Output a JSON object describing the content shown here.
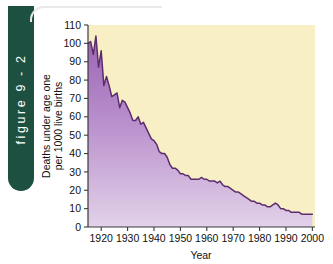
{
  "figure": {
    "tab_label": "figure 9 - 2"
  },
  "colors": {
    "tab_background": "#1d5040",
    "tab_text": "#ffffff",
    "plot_background": "#f8f0c4",
    "line": "#5c2d6e",
    "fill_top": "#9b64b4",
    "fill_bottom": "#e0cfe8",
    "axis": "#3a3a3a",
    "text": "#111111"
  },
  "chart_data": {
    "type": "area",
    "title": "",
    "xlabel": "Year",
    "ylabel": "Deaths under age one per 1000 live births",
    "ylabel_line1": "Deaths under age one",
    "ylabel_line2": "per 1000 live births",
    "xlim": [
      1915,
      2001
    ],
    "ylim": [
      0,
      110
    ],
    "grid": false,
    "legend": "none",
    "xticks": [
      1920,
      1930,
      1940,
      1950,
      1960,
      1970,
      1980,
      1990,
      2000
    ],
    "xtick_labels": [
      "1920",
      "1930",
      "1940",
      "1950",
      "1960",
      "1970",
      "1980",
      "1990",
      "2000"
    ],
    "yticks": [
      0,
      10,
      20,
      30,
      40,
      50,
      60,
      70,
      80,
      90,
      100,
      110
    ],
    "ytick_labels": [
      "0",
      "10",
      "20",
      "30",
      "40",
      "50",
      "60",
      "70",
      "80",
      "90",
      "100",
      "110"
    ],
    "series": [
      {
        "name": "Infant mortality rate",
        "x": [
          1915,
          1916,
          1917,
          1918,
          1919,
          1920,
          1921,
          1922,
          1923,
          1924,
          1925,
          1926,
          1927,
          1928,
          1929,
          1930,
          1931,
          1932,
          1933,
          1934,
          1935,
          1936,
          1937,
          1938,
          1939,
          1940,
          1941,
          1942,
          1943,
          1944,
          1945,
          1946,
          1947,
          1948,
          1949,
          1950,
          1951,
          1952,
          1953,
          1954,
          1955,
          1956,
          1957,
          1958,
          1959,
          1960,
          1961,
          1962,
          1963,
          1964,
          1965,
          1966,
          1967,
          1968,
          1969,
          1970,
          1971,
          1972,
          1973,
          1974,
          1975,
          1976,
          1977,
          1978,
          1979,
          1980,
          1981,
          1982,
          1983,
          1984,
          1985,
          1986,
          1987,
          1988,
          1989,
          1990,
          1991,
          1992,
          1993,
          1994,
          1995,
          1996,
          1997,
          1998,
          1999,
          2000
        ],
        "values": [
          100,
          101,
          94,
          104,
          87,
          96,
          77,
          82,
          77,
          71,
          72,
          73,
          65,
          69,
          68,
          65,
          62,
          58,
          58,
          60,
          56,
          57,
          54,
          51,
          48,
          47,
          45,
          41,
          40,
          40,
          38,
          34,
          32,
          32,
          31,
          29,
          29,
          28,
          28,
          26,
          26,
          26,
          26,
          27,
          26,
          26,
          25,
          25,
          25,
          24,
          25,
          23,
          22,
          22,
          21,
          20,
          19,
          19,
          18,
          17,
          16,
          15,
          14,
          14,
          13,
          13,
          12,
          12,
          11,
          11,
          12,
          13,
          12,
          10,
          10,
          9,
          9,
          8,
          8,
          8,
          8,
          7,
          7,
          7,
          7,
          7
        ]
      }
    ]
  }
}
